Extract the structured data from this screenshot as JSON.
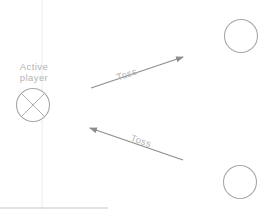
{
  "diagram": {
    "active_player": {
      "label_line1": "Active",
      "label_line2": "player",
      "icon": "crossed-circle-icon"
    },
    "players": [
      {
        "id": "top-right-player",
        "icon": "empty-circle-icon"
      },
      {
        "id": "bottom-right-player",
        "icon": "empty-circle-icon"
      }
    ],
    "arrows": [
      {
        "label": "Toss",
        "direction": "active-player-to-top-right"
      },
      {
        "label": "Toss",
        "direction": "bottom-right-to-active-player"
      }
    ],
    "colors": {
      "stroke": "#a8a8a8",
      "arrow": "#8c8c8c",
      "text": "#b4b4b4",
      "guide": "#ececec",
      "baseline": "#c8c8c8"
    }
  }
}
